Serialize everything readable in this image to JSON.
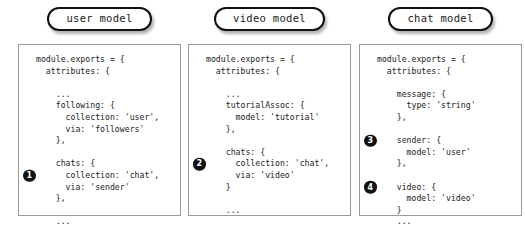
{
  "diagram": {
    "background_color": "#ffffff",
    "badge_color": "#111111",
    "panel_border_color": "#9a9a9a",
    "pill_border_color": "#111111",
    "columns": [
      {
        "title": "user model",
        "left": 18,
        "lines": [
          {
            "text": "module.exports = {"
          },
          {
            "text": "  attributes: {"
          },
          {
            "text": "",
            "blank": true
          },
          {
            "text": "    ..."
          },
          {
            "text": "    following: {"
          },
          {
            "text": "      collection: 'user',"
          },
          {
            "text": "      via: 'followers'"
          },
          {
            "text": "    },"
          },
          {
            "text": "",
            "blank": true
          },
          {
            "text": "    chats: {"
          },
          {
            "text": "      collection: 'chat',",
            "badge": "1"
          },
          {
            "text": "      via: 'sender'"
          },
          {
            "text": "    },"
          },
          {
            "text": "",
            "blank": true
          },
          {
            "text": "    ..."
          }
        ]
      },
      {
        "title": "video model",
        "left": 188,
        "lines": [
          {
            "text": "module.exports = {"
          },
          {
            "text": "  attributes: {"
          },
          {
            "text": "",
            "blank": true
          },
          {
            "text": "    ..."
          },
          {
            "text": "    tutorialAssoc: {"
          },
          {
            "text": "      model: 'tutorial'"
          },
          {
            "text": "    },"
          },
          {
            "text": "",
            "blank": true
          },
          {
            "text": "    chats: {"
          },
          {
            "text": "      collection: 'chat',",
            "badge": "2"
          },
          {
            "text": "      via: 'video'"
          },
          {
            "text": "    }"
          },
          {
            "text": "",
            "blank": true
          },
          {
            "text": "    ..."
          }
        ]
      },
      {
        "title": "chat model",
        "left": 359,
        "lines": [
          {
            "text": "module.exports = {"
          },
          {
            "text": "  attributes: {"
          },
          {
            "text": "",
            "blank": true
          },
          {
            "text": "    message: {"
          },
          {
            "text": "      type: 'string'"
          },
          {
            "text": "    },"
          },
          {
            "text": "",
            "blank": true
          },
          {
            "text": "    sender: {",
            "badge": "3"
          },
          {
            "text": "      model: 'user'"
          },
          {
            "text": "    },"
          },
          {
            "text": "",
            "blank": true
          },
          {
            "text": "    video: {",
            "badge": "4"
          },
          {
            "text": "      model: 'video'"
          },
          {
            "text": "    }"
          },
          {
            "text": "    ..."
          }
        ]
      }
    ]
  }
}
